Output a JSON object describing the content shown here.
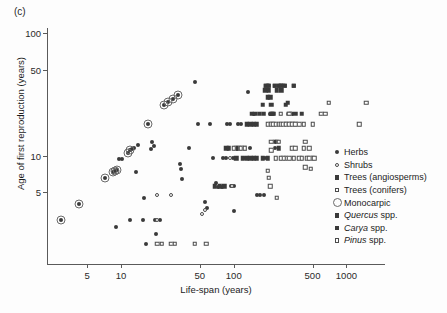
{
  "panel": {
    "label": "(c)"
  },
  "chart_data": {
    "type": "scatter",
    "title": "",
    "xlabel": "Life-span (years)",
    "ylabel": "Age of first reproduction (years)",
    "xscale": "log",
    "yscale": "log",
    "xlim": [
      2.2,
      2200
    ],
    "ylim": [
      1.3,
      110
    ],
    "xticks": [
      5,
      10,
      50,
      100,
      500,
      1000
    ],
    "xticklabels": [
      "5",
      "10",
      "50",
      "100",
      "500",
      "1000"
    ],
    "yticks": [
      5,
      10,
      50,
      100
    ],
    "yticklabels": [
      "5",
      "10",
      "50",
      "100"
    ],
    "grid": false,
    "legend_position": "right-inside",
    "legend": [
      {
        "label": "Herbs",
        "marker": "filled-circle",
        "class": "m-herb"
      },
      {
        "label": "Shrubs",
        "marker": "open-circle",
        "class": "m-shrub"
      },
      {
        "label": "Trees (angiosperms)",
        "marker": "filled-square",
        "class": "m-angio"
      },
      {
        "label": "Trees (conifers)",
        "marker": "open-square",
        "class": "m-conif"
      },
      {
        "label": "Monocarpic",
        "marker": "large-open-circle",
        "class": "m-mono"
      },
      {
        "label": "Quercus spp.",
        "label_italic": "Quercus",
        "label_rest": " spp.",
        "marker": "filled-square",
        "class": "m-quercus"
      },
      {
        "label": "Carya spp.",
        "label_italic": "Carya",
        "label_rest": " spp.",
        "marker": "filled-square",
        "class": "m-carya"
      },
      {
        "label": "Pinus spp.",
        "label_italic": "Pinus",
        "label_rest": " spp.",
        "marker": "open-square",
        "class": "m-pinus"
      }
    ],
    "series": [
      {
        "name": "Herbs",
        "marker": "filled-circle",
        "class": "m-herb",
        "points": [
          [
            2.9,
            3.0
          ],
          [
            4.2,
            4.0
          ],
          [
            7.2,
            6.6
          ],
          [
            8.5,
            7.3
          ],
          [
            8.8,
            7.5
          ],
          [
            9.2,
            7.6
          ],
          [
            9.6,
            9.3
          ],
          [
            10.2,
            9.4
          ],
          [
            9.0,
            2.6
          ],
          [
            12.0,
            3.0
          ],
          [
            13.5,
            7.4
          ],
          [
            11.5,
            10.5
          ],
          [
            12.0,
            11.0
          ],
          [
            12.5,
            11.2
          ],
          [
            13.0,
            11.6
          ],
          [
            14.0,
            12.2
          ],
          [
            15.5,
            3.0
          ],
          [
            16.0,
            4.5
          ],
          [
            17.5,
            18.0
          ],
          [
            18.5,
            11.3
          ],
          [
            19.0,
            13.0
          ],
          [
            19.5,
            12.0
          ],
          [
            16.5,
            1.9
          ],
          [
            20.5,
            2.3
          ],
          [
            20.0,
            3.0
          ],
          [
            22.0,
            3.0
          ],
          [
            24.0,
            26.0
          ],
          [
            26.0,
            27.5
          ],
          [
            29.0,
            29.0
          ],
          [
            32.0,
            31.0
          ],
          [
            33.0,
            8.6
          ],
          [
            34.0,
            7.8
          ],
          [
            35.0,
            6.4
          ],
          [
            40.0,
            11.5
          ],
          [
            45.0,
            40.0
          ],
          [
            48.0,
            18.0
          ],
          [
            55.0,
            4.2
          ],
          [
            58.0,
            3.7
          ],
          [
            62.0,
            18.0
          ],
          [
            66.0,
            9.5
          ],
          [
            70.0,
            6.0
          ],
          [
            72.0,
            5.5
          ],
          [
            78.0,
            5.5
          ],
          [
            80.0,
            9.5
          ],
          [
            85.0,
            9.5
          ],
          [
            88.0,
            18.0
          ],
          [
            92.0,
            18.0
          ],
          [
            95.0,
            5.6
          ],
          [
            98.0,
            9.5
          ],
          [
            100.0,
            3.5
          ],
          [
            100.0,
            5.6
          ],
          [
            105.0,
            9.5
          ],
          [
            110.0,
            18.0
          ],
          [
            115.0,
            18.0
          ],
          [
            118.0,
            11.5
          ],
          [
            125.0,
            9.5
          ],
          [
            130.0,
            9.5
          ],
          [
            135.0,
            33.0
          ],
          [
            140.0,
            11.5
          ],
          [
            150.0,
            22.0
          ],
          [
            160.0,
            4.8
          ],
          [
            170.0,
            4.8
          ],
          [
            185.0,
            4.8
          ],
          [
            190.0,
            9.5
          ],
          [
            200.0,
            18.0
          ],
          [
            210.0,
            22.0
          ],
          [
            230.0,
            11.5
          ],
          [
            260.0,
            18.0
          ],
          [
            300.0,
            22.0
          ],
          [
            330.0,
            22.0
          ]
        ]
      },
      {
        "name": "Shrubs",
        "marker": "open-circle",
        "class": "m-shrub",
        "points": [
          [
            21.0,
            4.8
          ],
          [
            28.0,
            4.8
          ],
          [
            21.0,
            3.0
          ],
          [
            52.0,
            3.3
          ],
          [
            55.0,
            3.6
          ],
          [
            92.0,
            9.5
          ],
          [
            96.0,
            5.6
          ]
        ]
      },
      {
        "name": "Trees (angiosperms)",
        "marker": "filled-square",
        "class": "m-angio",
        "points": [
          [
            105.0,
            11.5
          ],
          [
            110.0,
            11.5
          ],
          [
            118.0,
            11.5
          ],
          [
            125.0,
            11.5
          ],
          [
            130.0,
            18.0
          ],
          [
            140.0,
            18.0
          ],
          [
            145.0,
            22.0
          ],
          [
            150.0,
            18.0
          ],
          [
            155.0,
            22.0
          ],
          [
            160.0,
            18.0
          ],
          [
            170.0,
            22.0
          ],
          [
            180.0,
            26.0
          ],
          [
            185.0,
            22.0
          ],
          [
            190.0,
            34.0
          ],
          [
            195.0,
            37.0
          ],
          [
            200.0,
            37.0
          ],
          [
            205.0,
            34.0
          ],
          [
            210.0,
            30.0
          ],
          [
            215.0,
            22.0
          ],
          [
            220.0,
            18.0
          ],
          [
            225.0,
            22.0
          ],
          [
            230.0,
            37.0
          ],
          [
            240.0,
            34.0
          ],
          [
            250.0,
            37.0
          ],
          [
            260.0,
            37.0
          ],
          [
            265.0,
            34.0
          ],
          [
            270.0,
            37.0
          ],
          [
            280.0,
            37.0
          ],
          [
            290.0,
            26.0
          ],
          [
            300.0,
            27.0
          ],
          [
            310.0,
            22.0
          ],
          [
            320.0,
            22.0
          ],
          [
            340.0,
            37.0
          ],
          [
            350.0,
            22.0
          ],
          [
            400.0,
            22.0
          ],
          [
            180.0,
            9.5
          ],
          [
            200.0,
            9.5
          ],
          [
            230.0,
            13.0
          ],
          [
            240.0,
            13.0
          ],
          [
            250.0,
            11.5
          ],
          [
            160.0,
            9.5
          ],
          [
            150.0,
            9.5
          ],
          [
            140.0,
            9.5
          ],
          [
            130.0,
            9.5
          ],
          [
            120.0,
            9.5
          ],
          [
            105.0,
            9.5
          ],
          [
            86.0,
            11.5
          ],
          [
            90.0,
            11.5
          ],
          [
            75.0,
            5.6
          ],
          [
            82.0,
            5.6
          ],
          [
            68.0,
            5.6
          ]
        ]
      },
      {
        "name": "Trees (conifers)",
        "marker": "open-square",
        "class": "m-conif",
        "points": [
          [
            200.0,
            18.0
          ],
          [
            215.0,
            18.0
          ],
          [
            225.0,
            18.0
          ],
          [
            235.0,
            18.0
          ],
          [
            250.0,
            18.0
          ],
          [
            260.0,
            18.0
          ],
          [
            275.0,
            18.0
          ],
          [
            290.0,
            18.0
          ],
          [
            310.0,
            18.0
          ],
          [
            330.0,
            18.0
          ],
          [
            350.0,
            18.0
          ],
          [
            380.0,
            18.0
          ],
          [
            420.0,
            18.0
          ],
          [
            500.0,
            18.0
          ],
          [
            600.0,
            22.0
          ],
          [
            650.0,
            22.0
          ],
          [
            700.0,
            27.0
          ],
          [
            1300.0,
            18.0
          ],
          [
            1500.0,
            27.0
          ],
          [
            330.0,
            11.5
          ],
          [
            350.0,
            11.5
          ],
          [
            420.0,
            11.5
          ],
          [
            450.0,
            9.5
          ],
          [
            470.0,
            9.5
          ],
          [
            500.0,
            9.5
          ],
          [
            520.0,
            9.5
          ],
          [
            380.0,
            9.5
          ],
          [
            400.0,
            9.5
          ],
          [
            340.0,
            9.5
          ],
          [
            310.0,
            9.5
          ],
          [
            290.0,
            9.5
          ],
          [
            275.0,
            9.5
          ],
          [
            260.0,
            9.5
          ],
          [
            235.0,
            9.5
          ],
          [
            215.0,
            11.0
          ],
          [
            200.0,
            7.5
          ],
          [
            205.0,
            6.6
          ],
          [
            210.0,
            5.6
          ],
          [
            240.0,
            4.5
          ],
          [
            215.0,
            13.0
          ],
          [
            250.0,
            13.0
          ],
          [
            430.0,
            8.0
          ],
          [
            480.0,
            7.8
          ],
          [
            470.0,
            11.5
          ],
          [
            430.0,
            13.0
          ],
          [
            260.0,
            22.0
          ],
          [
            310.0,
            22.0
          ],
          [
            115.0,
            11.5
          ],
          [
            125.0,
            11.5
          ],
          [
            100.0,
            11.5
          ],
          [
            57.0,
            1.9
          ],
          [
            45.0,
            1.9
          ],
          [
            21.0,
            1.9
          ],
          [
            23.0,
            1.9
          ],
          [
            28.0,
            1.9
          ],
          [
            30.0,
            1.9
          ],
          [
            205.0,
            37.0
          ],
          [
            270.0,
            37.0
          ]
        ]
      },
      {
        "name": "Quercus spp.",
        "marker": "filled-square",
        "class": "m-quercus",
        "points": [
          [
            195.0,
            37.0
          ],
          [
            205.0,
            37.0
          ],
          [
            230.0,
            37.0
          ],
          [
            250.0,
            37.0
          ],
          [
            260.0,
            37.0
          ],
          [
            280.0,
            37.0
          ],
          [
            340.0,
            37.0
          ]
        ]
      },
      {
        "name": "Carya spp.",
        "marker": "filled-square",
        "class": "m-carya",
        "points": [
          [
            200.0,
            30.0
          ],
          [
            215.0,
            26.0
          ],
          [
            220.0,
            22.0
          ]
        ]
      },
      {
        "name": "Pinus spp.",
        "marker": "open-square",
        "class": "m-pinus",
        "points": [
          [
            290.0,
            18.0
          ],
          [
            310.0,
            18.0
          ],
          [
            330.0,
            18.0
          ],
          [
            350.0,
            18.0
          ]
        ]
      },
      {
        "name": "Monocarpic",
        "marker": "large-open-circle",
        "class": "m-mono",
        "points": [
          [
            2.9,
            3.0
          ],
          [
            4.2,
            4.0
          ],
          [
            7.2,
            6.6
          ],
          [
            8.5,
            7.3
          ],
          [
            8.8,
            7.5
          ],
          [
            9.2,
            7.6
          ],
          [
            11.5,
            10.5
          ],
          [
            12.0,
            11.0
          ],
          [
            17.5,
            18.0
          ],
          [
            24.0,
            26.0
          ],
          [
            26.0,
            27.5
          ],
          [
            29.0,
            29.0
          ],
          [
            32.0,
            31.0
          ]
        ]
      }
    ]
  }
}
